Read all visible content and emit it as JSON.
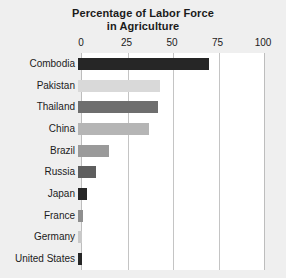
{
  "chart_data": {
    "type": "bar",
    "orientation": "horizontal",
    "title": "Percentage of Labor Force in Agriculture",
    "title_lines": [
      "Percentage of Labor Force",
      "in Agriculture"
    ],
    "xlabel": "",
    "ylabel": "",
    "xlim": [
      0,
      100
    ],
    "xticks": [
      0,
      25,
      50,
      75,
      100
    ],
    "xtick_labels": [
      "0",
      "25",
      "50",
      "75",
      "100"
    ],
    "grid": true,
    "grid_axis": "x",
    "legend": false,
    "categories": [
      "Combodia",
      "Pakistan",
      "Thailand",
      "China",
      "Brazil",
      "Russia",
      "Japan",
      "France",
      "Germany",
      "United States"
    ],
    "values": [
      72,
      45,
      44,
      39,
      17,
      10,
      5,
      3,
      2,
      2
    ],
    "bar_colors": [
      "#262626",
      "#d9d9d9",
      "#6e6e6e",
      "#b5b5b5",
      "#9a9a9a",
      "#5e5e5e",
      "#262626",
      "#8f8f8f",
      "#c9c9c9",
      "#262626"
    ],
    "bars": [
      {
        "label": "Combodia",
        "value": 72,
        "color": "#262626"
      },
      {
        "label": "Pakistan",
        "value": 45,
        "color": "#d9d9d9"
      },
      {
        "label": "Thailand",
        "value": 44,
        "color": "#6e6e6e"
      },
      {
        "label": "China",
        "value": 39,
        "color": "#b5b5b5"
      },
      {
        "label": "Brazil",
        "value": 17,
        "color": "#9a9a9a"
      },
      {
        "label": "Russia",
        "value": 10,
        "color": "#5e5e5e"
      },
      {
        "label": "Japan",
        "value": 5,
        "color": "#262626"
      },
      {
        "label": "France",
        "value": 3,
        "color": "#8f8f8f"
      },
      {
        "label": "Germany",
        "value": 2,
        "color": "#c9c9c9"
      },
      {
        "label": "United States",
        "value": 2,
        "color": "#262626"
      }
    ]
  },
  "style": {
    "background": "#efefef",
    "plot_background": "#ffffff",
    "gridline_color": "#c4c4c4",
    "text_color": "#1b1b1b"
  }
}
